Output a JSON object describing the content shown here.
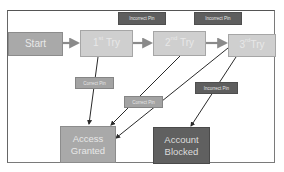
{
  "diagram": {
    "type": "state-flow",
    "nodes": [
      {
        "id": "start",
        "label": "Start"
      },
      {
        "id": "try1",
        "label": "1",
        "suffix": "st",
        "word": "Try"
      },
      {
        "id": "try2",
        "label": "2",
        "suffix": "nd",
        "word": "Try"
      },
      {
        "id": "try3",
        "label": "3",
        "suffix": "rd",
        "word": "Try"
      },
      {
        "id": "granted",
        "line1": "Access",
        "line2": "Granted"
      },
      {
        "id": "blocked",
        "line1": "Account",
        "line2": "Blocked"
      }
    ],
    "edge_labels": {
      "incorrect_1": "Incorrect Pin",
      "incorrect_2": "Incorrect Pin",
      "incorrect_3": "Incorrect Pin",
      "correct_1": "Correct Pin",
      "correct_2": "Correct Pin"
    },
    "edges": [
      {
        "from": "start",
        "to": "try1",
        "label": ""
      },
      {
        "from": "try1",
        "to": "try2",
        "label": "Incorrect Pin"
      },
      {
        "from": "try2",
        "to": "try3",
        "label": "Incorrect Pin"
      },
      {
        "from": "try1",
        "to": "granted",
        "label": "Correct Pin"
      },
      {
        "from": "try2",
        "to": "granted",
        "label": "Correct Pin"
      },
      {
        "from": "try3",
        "to": "granted",
        "label": ""
      },
      {
        "from": "try3",
        "to": "blocked",
        "label": "Incorrect Pin"
      }
    ],
    "colors": {
      "start": "#a9a9a9",
      "try": "#cfcfcf",
      "granted": "#a9a9a9",
      "blocked": "#606060",
      "incorrect_label": "#5e5e5e",
      "correct_label": "#a3a3a3",
      "edge": "#2a2a2a"
    }
  }
}
